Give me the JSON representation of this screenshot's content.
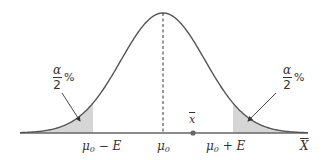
{
  "diagram": {
    "title": "",
    "type": "normal distribution two-tailed hypothesis test",
    "colors": {
      "curve": "#555555",
      "axis": "#666666",
      "shaded_tail": "#d6d6d6",
      "text": "#333333",
      "dot": "#666666"
    },
    "curve": {
      "mean_x": 163,
      "peak_y": 13,
      "baseline_y": 133,
      "sigma_px": 42,
      "x_start": 20,
      "x_end": 308
    },
    "labels": {
      "left_critical": {
        "main": "μ",
        "sub": "0",
        "rest": " − E"
      },
      "mean": {
        "main": "μ",
        "sub": "0"
      },
      "right_critical": {
        "main": "μ",
        "sub": "0",
        "rest": " + E"
      },
      "axis_variable": "X",
      "sample_mean": "x"
    },
    "tail_annotations": {
      "left": {
        "numerator": "α",
        "denominator": "2",
        "suffix": "%"
      },
      "right": {
        "numerator": "α",
        "denominator": "2",
        "suffix": "%"
      }
    },
    "markers": {
      "left_critical_x": 93,
      "right_critical_x": 233,
      "sample_mean_x": 193
    }
  }
}
